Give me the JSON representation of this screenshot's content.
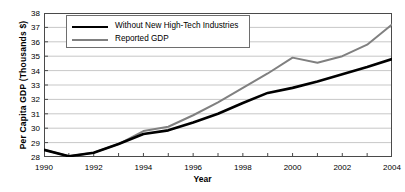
{
  "chart_data": {
    "type": "line",
    "title": "",
    "xlabel": "Year",
    "ylabel": "Per Capita GDP (Thousands $)",
    "x": [
      1990,
      1991,
      1992,
      1993,
      1994,
      1995,
      1996,
      1997,
      1998,
      1999,
      2000,
      2001,
      2002,
      2003,
      2004
    ],
    "categories": [
      "1990",
      "1991",
      "1992",
      "1993",
      "1994",
      "1995",
      "1996",
      "1997",
      "1998",
      "1999",
      "2000",
      "2001",
      "2002",
      "2003",
      "2004"
    ],
    "xtick_labels": [
      "1990",
      "1992",
      "1994",
      "1996",
      "1998",
      "2000",
      "2002",
      "2004"
    ],
    "ytick_labels": [
      "28",
      "29",
      "30",
      "31",
      "32",
      "33",
      "34",
      "35",
      "36",
      "37",
      "38"
    ],
    "xlim": [
      1990,
      2004
    ],
    "ylim": [
      28,
      38
    ],
    "grid": true,
    "legend_position": "top-left",
    "series": [
      {
        "name": "Without New High-Tech Industries",
        "color": "#000000",
        "values": [
          28.5,
          28.05,
          28.3,
          28.9,
          29.6,
          29.85,
          30.4,
          31.0,
          31.75,
          32.45,
          32.8,
          33.25,
          33.75,
          34.25,
          34.8
        ]
      },
      {
        "name": "Reported GDP",
        "color": "#808080",
        "values": [
          28.5,
          28.05,
          28.3,
          28.9,
          29.8,
          30.1,
          30.9,
          31.8,
          32.8,
          33.8,
          34.9,
          34.55,
          35.0,
          35.8,
          37.2
        ]
      }
    ]
  }
}
